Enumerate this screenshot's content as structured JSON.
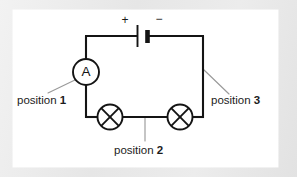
{
  "figure": {
    "kind": "electrical-circuit-schematic",
    "background_color": "#ececec",
    "panel_color": "#ffffff",
    "ink_color": "#141414",
    "leader_color": "#9a9a9a"
  },
  "battery": {
    "name": "battery-cell",
    "positive_sign": "+",
    "negative_sign": "−"
  },
  "ammeter": {
    "name": "ammeter",
    "symbol_letter": "A"
  },
  "lamps": [
    {
      "name": "lamp-left"
    },
    {
      "name": "lamp-right"
    }
  ],
  "labels": [
    {
      "id": "position-1",
      "text": "position ",
      "number": "1"
    },
    {
      "id": "position-2",
      "text": "position ",
      "number": "2"
    },
    {
      "id": "position-3",
      "text": "position ",
      "number": "3"
    }
  ]
}
